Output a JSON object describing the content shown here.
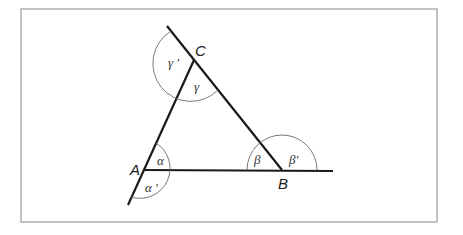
{
  "diagram": {
    "type": "geometry",
    "vertices": {
      "A": {
        "label": "A",
        "x": 144,
        "y": 170
      },
      "B": {
        "label": "B",
        "x": 282,
        "y": 170
      },
      "C": {
        "label": "C",
        "x": 194,
        "y": 60
      }
    },
    "interior_angles": {
      "alpha": "α",
      "beta": "β",
      "gamma": "γ"
    },
    "exterior_angles": {
      "alpha_prime": "α ′",
      "beta_prime": "β′",
      "gamma_prime": "γ ′"
    },
    "colors": {
      "lines": "#1a1a1a",
      "arcs": "#6a6a6a",
      "frame": "#9a9a9a",
      "background": "#ffffff"
    }
  }
}
